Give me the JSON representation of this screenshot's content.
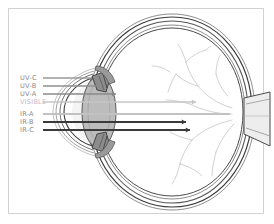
{
  "figure": {
    "frame": {
      "border_color": "#d2d2d2",
      "background": "#ffffff"
    }
  },
  "labels": [
    {
      "id": "uv-c",
      "text": "UV-C",
      "color": "#8a8a8a",
      "y": 74.5,
      "ray_y": 78.0,
      "ray_color": "#9a9a9a",
      "ray_width": 1.6,
      "end_x": 92,
      "head": false
    },
    {
      "id": "uv-b",
      "text": "UV-B",
      "color": "#8a8a8a",
      "y": 82.5,
      "ray_y": 86.0,
      "ray_color": "#8f8f8f",
      "ray_width": 1.6,
      "end_x": 96,
      "head": false
    },
    {
      "id": "uv-a",
      "text": "UV-A",
      "color": "#8a8a8a",
      "y": 90.5,
      "ray_y": 94.0,
      "ray_color": "#8a8a8a",
      "ray_width": 1.6,
      "end_x": 116,
      "head": true
    },
    {
      "id": "visible",
      "text": "VISIBLE",
      "color": "#c8b9c4",
      "y": 98.5,
      "ray_y": 102.0,
      "ray_color": "#c6c6c6",
      "ray_width": 1.5,
      "end_x": 196,
      "head": true
    },
    {
      "id": "ir-a",
      "text": "IR-A",
      "color": "#8a8a8a",
      "y": 110.5,
      "ray_y": 114.0,
      "ray_color": "#c2c2c2",
      "ray_width": 2.0,
      "end_x": 230,
      "head": false
    },
    {
      "id": "ir-b",
      "text": "IR-B",
      "color": "#8a8a8a",
      "y": 118.5,
      "ray_y": 122.0,
      "ray_color": "#3a3a3a",
      "ray_width": 1.8,
      "end_x": 186,
      "head": true
    },
    {
      "id": "ir-c",
      "text": "IR-C",
      "color": "#8a8a8a",
      "y": 126.5,
      "ray_y": 130.0,
      "ray_color": "#3a3a3a",
      "ray_width": 1.8,
      "end_x": 190,
      "head": true
    }
  ],
  "label_x": 20,
  "anatomy": {
    "sclera": "sclera-outline",
    "cornea": "cornea",
    "lens": "lens",
    "iris": "iris",
    "retina": "retina",
    "optic_nerve": "optic-nerve",
    "vitreous": "vitreous-body",
    "blood_vessels": "retinal-blood-vessels"
  },
  "colors": {
    "outline": "#3c3c3c",
    "sclera_fill": "#ffffff",
    "lens_fill": "#b9b9b9",
    "iris_fill": "#8f8f8f",
    "cornea_fill": "#d8d8d8",
    "nerve_fill": "#e2e2e2",
    "vessel": "#b0b0b0"
  }
}
